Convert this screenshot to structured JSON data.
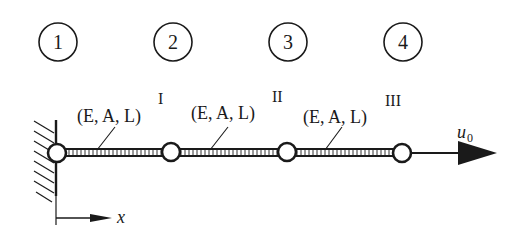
{
  "diagram": {
    "type": "bar-element-system",
    "nodes": [
      {
        "id": "1",
        "label": "1"
      },
      {
        "id": "2",
        "label": "2"
      },
      {
        "id": "3",
        "label": "3"
      },
      {
        "id": "4",
        "label": "4"
      }
    ],
    "elements": [
      {
        "property": "(E, A, L)",
        "index": "I"
      },
      {
        "property": "(E, A, L)",
        "index": "II"
      },
      {
        "property": "(E, A, L)",
        "index": "III"
      }
    ],
    "load": {
      "label": "u",
      "subscript": "0"
    },
    "axis": {
      "label": "x"
    },
    "support": "fixed-wall"
  }
}
